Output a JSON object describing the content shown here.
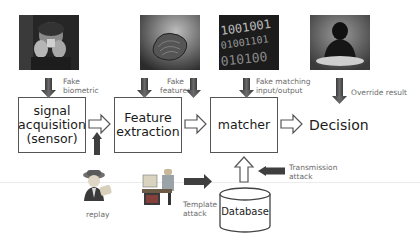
{
  "diagram": {
    "stages": [
      {
        "id": "signal",
        "line1": "signal",
        "line2": "acquisition",
        "line3": "(sensor)"
      },
      {
        "id": "feature",
        "line1": "Feature",
        "line2": "extraction"
      },
      {
        "id": "matcher",
        "line1": "matcher"
      },
      {
        "id": "decision",
        "line1": "Decision"
      }
    ],
    "database": {
      "label": "Database"
    },
    "attacks": {
      "fake_biometric": {
        "line1": "Fake",
        "line2": "biometric",
        "icon": "person-holding-fake-finger-photo"
      },
      "fake_features": {
        "line1": "Fake",
        "line2": "features",
        "icon": "fingerprint-texture-photo"
      },
      "fake_matching": {
        "line1": "Fake matching",
        "line2": "input/output",
        "icon": "binary-code-photo"
      },
      "override": {
        "line1": "Override result",
        "icon": "hacker-at-keyboard-photo"
      },
      "replay": {
        "line1": "replay",
        "icon": "spy-detective-icon"
      },
      "template": {
        "line1": "Template",
        "line2": "attack",
        "icon": "person-at-computer-icon"
      },
      "transmission": {
        "line1": "Transmission",
        "line2": "attack"
      }
    },
    "colors": {
      "attack_arrow": "#4a4a4a",
      "flow_arrow_outline": "#555555",
      "box_border": "#555555",
      "label_gray": "#6b6b6b",
      "text": "#1a1a1a"
    }
  }
}
